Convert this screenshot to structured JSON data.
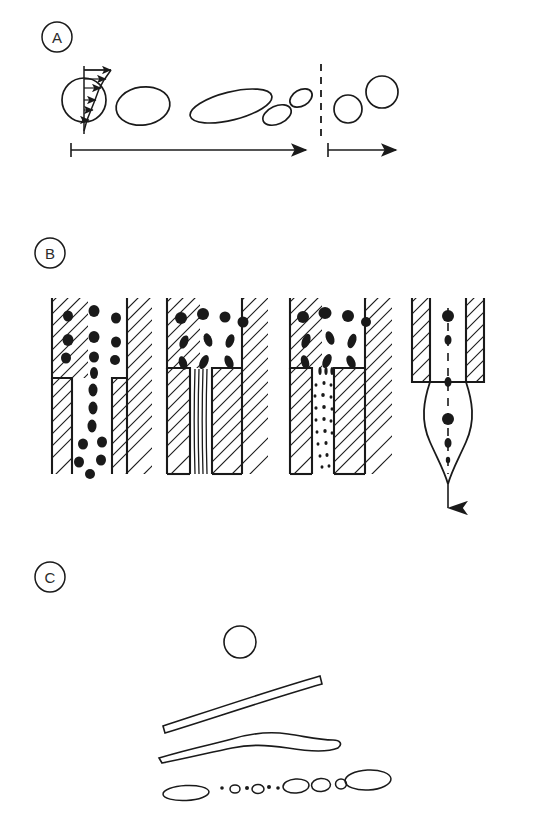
{
  "figure": {
    "background_color": "#ffffff",
    "ink_color": "#1a1a1a",
    "width": 533,
    "height": 829
  },
  "panels": [
    {
      "id": "A",
      "label": "A",
      "caption": "Droplet deformation under shear flow followed by breakup and relaxation",
      "label_pos": {
        "x": 57,
        "y": 37
      },
      "stages": [
        {
          "name": "sphere-in-shear-field",
          "shape": "circle",
          "cx": 84,
          "cy": 100,
          "r": 22
        },
        {
          "name": "deformed-ellipse",
          "shape": "ellipse",
          "cx": 143,
          "cy": 106,
          "rx": 27,
          "ry": 19,
          "rot": -8
        },
        {
          "name": "elongated-ellipsoid",
          "shape": "ellipse",
          "cx": 231,
          "cy": 106,
          "rx": 42,
          "ry": 14,
          "rot": -14
        },
        {
          "name": "daughter-droplet-small",
          "shape": "ellipse",
          "cx": 275,
          "cy": 114,
          "rx": 15,
          "ry": 9,
          "rot": -22
        },
        {
          "name": "daughter-droplet-smaller",
          "shape": "ellipse",
          "cx": 300,
          "cy": 99,
          "rx": 12,
          "ry": 8,
          "rot": -28
        },
        {
          "name": "relaxed-droplet-1",
          "shape": "circle",
          "cx": 348,
          "cy": 108,
          "r": 14
        },
        {
          "name": "relaxed-droplet-2",
          "shape": "circle",
          "cx": 382,
          "cy": 93,
          "r": 16
        }
      ],
      "shear_profile": {
        "name": "velocity-gradient-arrows",
        "arrow_count": 6
      },
      "divider": {
        "name": "phase-divider-dashed",
        "x": 321,
        "y1": 64,
        "y2": 142
      },
      "axes": [
        {
          "name": "deformation-axis-arrow",
          "x1": 71,
          "x2": 310,
          "y": 150
        },
        {
          "name": "relaxation-axis-arrow",
          "x1": 328,
          "x2": 399,
          "y": 150
        }
      ]
    },
    {
      "id": "B",
      "label": "B",
      "caption": "Flow of dispersed phase through a contraction: dispersion, filament formation, filament breakup, and single-stream jetting",
      "label_pos": {
        "x": 50,
        "y": 253
      },
      "substages": [
        {
          "name": "nozzle-dispersed-droplets",
          "index": 1,
          "x": 52,
          "mode": "dispersed"
        },
        {
          "name": "nozzle-stretched-filaments",
          "index": 2,
          "x": 165,
          "mode": "filaments"
        },
        {
          "name": "nozzle-filament-breakup",
          "index": 3,
          "x": 288,
          "mode": "breakup"
        },
        {
          "name": "nozzle-single-jet",
          "index": 4,
          "x": 410,
          "mode": "jet"
        }
      ]
    },
    {
      "id": "C",
      "label": "C",
      "caption": "Capillary (Rayleigh) instability of an extended filament breaking into main and satellite droplets",
      "label_pos": {
        "x": 50,
        "y": 577
      },
      "stages": [
        {
          "name": "initial-sphere",
          "shape": "circle",
          "cx": 240,
          "cy": 642,
          "r": 16
        },
        {
          "name": "straight-filament",
          "shape": "filament",
          "x1": 165,
          "y1": 725,
          "x2": 320,
          "y2": 676
        },
        {
          "name": "undulating-filament",
          "shape": "wavy-filament",
          "x1": 160,
          "y1": 757,
          "x2": 332,
          "y2": 742
        },
        {
          "name": "broken-droplet-row",
          "shape": "droplet-row",
          "droplets": [
            {
              "cx": 185,
              "cy": 793,
              "rx": 22,
              "ry": 7
            },
            {
              "cx": 223,
              "cy": 787,
              "rx": 2,
              "ry": 2
            },
            {
              "cx": 235,
              "cy": 789,
              "rx": 5,
              "ry": 4
            },
            {
              "cx": 247,
              "cy": 787,
              "rx": 3,
              "ry": 2
            },
            {
              "cx": 258,
              "cy": 789,
              "rx": 6,
              "ry": 4
            },
            {
              "cx": 269,
              "cy": 787,
              "rx": 3,
              "ry": 2
            },
            {
              "cx": 277,
              "cy": 788,
              "rx": 2,
              "ry": 2
            },
            {
              "cx": 295,
              "cy": 786,
              "rx": 13,
              "ry": 7
            },
            {
              "cx": 320,
              "cy": 785,
              "rx": 9,
              "ry": 6
            },
            {
              "cx": 340,
              "cy": 784,
              "rx": 5,
              "ry": 5
            },
            {
              "cx": 367,
              "cy": 780,
              "rx": 22,
              "ry": 10
            }
          ]
        }
      ]
    }
  ]
}
